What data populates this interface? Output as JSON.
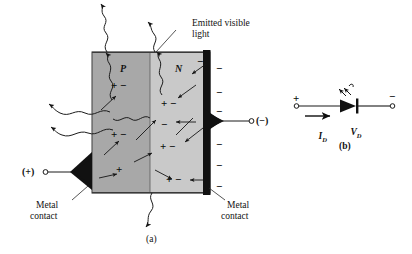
{
  "figure": {
    "captions": {
      "a": "(a)",
      "b": "(b)"
    },
    "colors": {
      "p_region": "#a8a8a8",
      "n_region": "#c9c9c9",
      "contact": "#111111",
      "outline": "#3a3a3a",
      "ink": "#121212",
      "background": "#ffffff"
    }
  },
  "diagram_a": {
    "labels": {
      "emitted_light": "Emitted visible\nlight",
      "emitted_light_line1": "Emitted visible",
      "emitted_light_line2": "light",
      "p_region": "P",
      "n_region": "N",
      "metal_contact_left_line1": "Metal",
      "metal_contact_left_line2": "contact",
      "metal_contact_right_line1": "Metal",
      "metal_contact_right_line2": "contact",
      "terminal_positive": "(+)",
      "terminal_negative": "(−)"
    },
    "carriers": {
      "p_side": [
        "+ −",
        "+ −",
        "+"
      ],
      "n_side": [
        "−",
        "+ −",
        "−",
        "+ −",
        "+ −"
      ],
      "cathode_bar_minus_count": 6,
      "cathode_bar_sign": "−"
    }
  },
  "diagram_b": {
    "labels": {
      "anode_sign": "+",
      "cathode_sign": "−",
      "current": "I",
      "current_sub": "D",
      "voltage": "V",
      "voltage_sub": "D"
    },
    "symbol": {
      "name": "led-diode-symbol",
      "emission_arrows": 2
    }
  }
}
